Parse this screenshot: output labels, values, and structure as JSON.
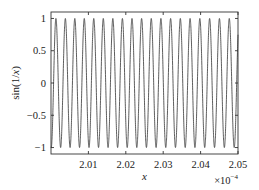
{
  "chart_data": {
    "type": "line",
    "title": "",
    "function": "sin(1/x)",
    "xlabel": "x",
    "ylabel": "sin(1/x)",
    "xlim": [
      2.0,
      2.05
    ],
    "ylim": [
      -1.1,
      1.1
    ],
    "x_multiplier": "×10^-4",
    "x_multiplier_base": "×10",
    "x_multiplier_exp": "−4",
    "xticks": [
      2.01,
      2.02,
      2.03,
      2.04,
      2.05
    ],
    "xtick_labels": [
      "2.01",
      "2.02",
      "2.03",
      "2.04",
      "2.05"
    ],
    "yticks": [
      -1,
      -0.5,
      0,
      0.5,
      1
    ],
    "ytick_labels": [
      "−1",
      "−0.5",
      "0",
      "0.5",
      "1"
    ],
    "grid": false,
    "legend": null,
    "series": [
      {
        "name": "sin(1/x)",
        "x_range": [
          0.0002,
          0.000205
        ],
        "approx_cycles": 19.4,
        "amplitude": 1
      }
    ]
  },
  "colors": {
    "line": "#333333",
    "axes": "#333333",
    "background": "#ffffff"
  }
}
